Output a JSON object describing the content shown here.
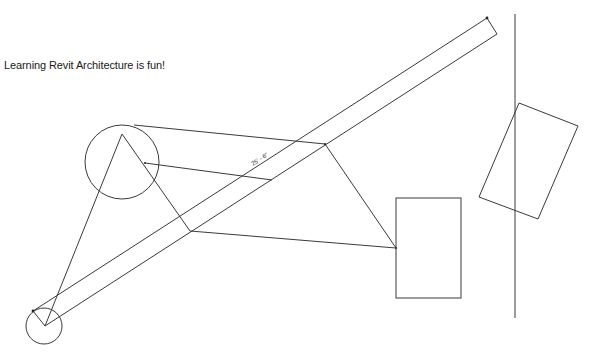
{
  "drawing": {
    "text_note": "Learning Revit Architecture is fun!",
    "text_note_pos": {
      "x": 4,
      "y": 65
    },
    "dimension_label": "25' - 6\"",
    "line_color": "#3a3a3a",
    "background": "#ffffff"
  },
  "elements": {
    "large_circle": {
      "cx": 122,
      "cy": 162,
      "r": 37
    },
    "small_circle": {
      "cx": 44,
      "cy": 326,
      "r": 18
    },
    "wall_band": {
      "start": {
        "x": 32,
        "y": 311
      },
      "end": {
        "x": 487,
        "y": 18
      },
      "offset_line_start": {
        "x": 44,
        "y": 326
      },
      "offset_line_end": {
        "x": 497,
        "y": 34
      }
    },
    "triangle_lines": [
      {
        "x1": 122,
        "y1": 135,
        "x2": 44,
        "y2": 326
      },
      {
        "x1": 122,
        "y1": 135,
        "x2": 190,
        "y2": 231
      },
      {
        "x1": 190,
        "y1": 231,
        "x2": 396,
        "y2": 248
      },
      {
        "x1": 396,
        "y1": 248,
        "x2": 325,
        "y2": 144
      },
      {
        "x1": 325,
        "y1": 144,
        "x2": 134,
        "y2": 125
      },
      {
        "x1": 145,
        "y1": 163,
        "x2": 272,
        "y2": 180
      }
    ],
    "rectangle": {
      "x": 396,
      "y": 198,
      "width": 65,
      "height": 100
    },
    "rotated_rectangle": {
      "points": [
        {
          "x": 519,
          "y": 103
        },
        {
          "x": 578,
          "y": 126
        },
        {
          "x": 538,
          "y": 219
        },
        {
          "x": 479,
          "y": 197
        }
      ]
    },
    "vertical_line": {
      "x": 515,
      "y1": 14,
      "y2": 318
    }
  }
}
